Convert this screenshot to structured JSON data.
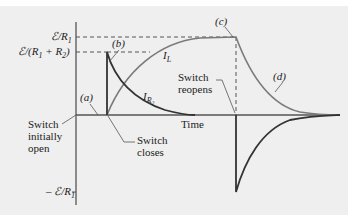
{
  "diagram": {
    "type": "RL circuit current vs time",
    "colors": {
      "background": "#efefef",
      "axis": "#555555",
      "i_l_curve": "#7a7a7a",
      "i_r2_curve": "#333333",
      "dashed": "#555555"
    },
    "y_labels": {
      "top": "ℰ/R",
      "top_sub": "1",
      "mid_a": "ℰ/(R",
      "mid_sub1": "1",
      "mid_b": " + R",
      "mid_sub2": "2",
      "mid_c": ")",
      "neg_a": "– ℰ/R",
      "neg_sub": "1"
    },
    "x_label": "Time",
    "point_labels": {
      "a": "(a)",
      "b": "(b)",
      "c": "(c)",
      "d": "(d)"
    },
    "curve_labels": {
      "il": "I",
      "il_sub": "L",
      "ir2": "I",
      "ir2_sub": "R₂"
    },
    "annotations": {
      "initially_open": [
        "Switch",
        "initially",
        "open"
      ],
      "closes": [
        "Switch",
        "closes"
      ],
      "reopens": [
        "Switch",
        "reopens"
      ]
    }
  }
}
